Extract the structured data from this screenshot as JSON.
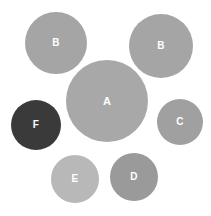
{
  "figure": {
    "type": "bubble-diagram",
    "background_color": "#ffffff",
    "width": 211,
    "height": 216,
    "label_color": "#ffffff"
  },
  "chart_data": {
    "type": "scatter",
    "title": "",
    "subtitle": "",
    "xlabel": "",
    "ylabel": "",
    "grid": false,
    "legend": false,
    "axis_visible": false,
    "xlim": [
      0,
      211
    ],
    "ylim": [
      0,
      216
    ],
    "size_encoding": "radius",
    "categories": [
      "A",
      "B",
      "B",
      "C",
      "D",
      "E",
      "F"
    ],
    "points": [
      {
        "label": "A",
        "x": 107,
        "y": 101,
        "r": 41,
        "color": "#a8a8a8",
        "font_size": 11
      },
      {
        "label": "B",
        "x": 56,
        "y": 43,
        "r": 31,
        "color": "#a5a5a5",
        "font_size": 10
      },
      {
        "label": "B",
        "x": 161,
        "y": 46,
        "r": 32,
        "color": "#a5a5a5",
        "font_size": 10
      },
      {
        "label": "C",
        "x": 180,
        "y": 122,
        "r": 23,
        "color": "#a0a0a0",
        "font_size": 10
      },
      {
        "label": "D",
        "x": 134,
        "y": 177,
        "r": 24,
        "color": "#9a9a9a",
        "font_size": 10
      },
      {
        "label": "E",
        "x": 75,
        "y": 179,
        "r": 24,
        "color": "#b8b8b8",
        "font_size": 10
      },
      {
        "label": "F",
        "x": 36,
        "y": 125,
        "r": 25,
        "color": "#3a3a3a",
        "font_size": 10
      }
    ]
  }
}
